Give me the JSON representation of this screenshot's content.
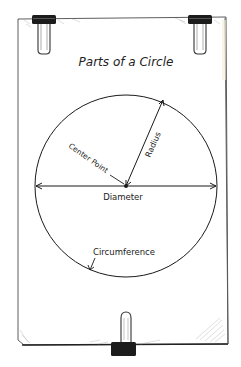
{
  "title": "Parts of a Circle",
  "labels": {
    "center_point": "Center Point",
    "radius": "Radius",
    "diameter": "Diameter",
    "circumference": "Circumference"
  },
  "colors": {
    "paper": "#ffffff",
    "ink": "#1a1a1a",
    "clip": "#1c1c1c",
    "shadow": "#b9b9b9"
  }
}
